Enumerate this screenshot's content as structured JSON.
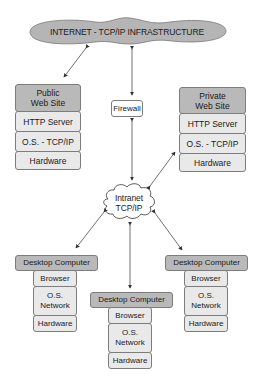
{
  "diagram": {
    "internet_cloud": {
      "label": "INTERNET - TCP/IP INFRASTRUCTURE"
    },
    "firewall": {
      "label": "Firewall"
    },
    "intranet_cloud": {
      "line1": "Intranet",
      "line2": "TCP/IP"
    },
    "public_site": {
      "title_line1": "Public",
      "title_line2": "Web Site",
      "layers": [
        "HTTP Server",
        "O.S. - TCP/IP",
        "Hardware"
      ]
    },
    "private_site": {
      "title_line1": "Private",
      "title_line2": "Web Site",
      "layers": [
        "HTTP Server",
        "O.S. - TCP/IP",
        "Hardware"
      ]
    },
    "desktops": [
      {
        "title": "Desktop Computer",
        "browser": "Browser",
        "os_line1": "O.S.",
        "os_line2": "Network",
        "hardware": "Hardware"
      },
      {
        "title": "Desktop Computer",
        "browser": "Browser",
        "os_line1": "O.S.",
        "os_line2": "Network",
        "hardware": "Hardware"
      },
      {
        "title": "Desktop Computer",
        "browser": "Browser",
        "os_line1": "O.S.",
        "os_line2": "Network",
        "hardware": "Hardware"
      }
    ],
    "colors": {
      "cloud_fill": "#b5b5b5",
      "header_fill": "#b9b9b9",
      "layer_fill": "#e9e9e9",
      "border": "#7d7d7d"
    }
  }
}
